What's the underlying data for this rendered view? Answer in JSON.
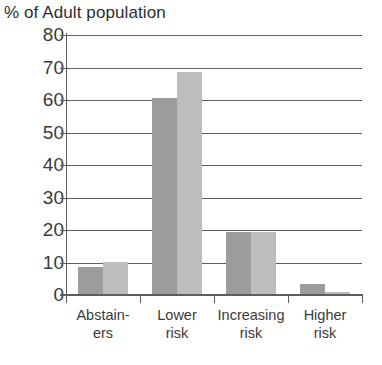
{
  "chart_data": {
    "type": "bar",
    "title": "% of Adult population",
    "xlabel": "",
    "ylabel": "",
    "ylim": [
      0,
      80
    ],
    "ytick_step": 10,
    "yticks": [
      80,
      70,
      60,
      50,
      40,
      30,
      20,
      10,
      0
    ],
    "grid": true,
    "legend": false,
    "legend_position": "none",
    "categories": [
      "Abstain-\ners",
      "Lower\nrisk",
      "Increasing\nrisk",
      "Higher\nrisk"
    ],
    "category_lines": [
      [
        "Abstain-",
        "ers"
      ],
      [
        "Lower",
        "risk"
      ],
      [
        "Increasing",
        "risk"
      ],
      [
        "Higher",
        "risk"
      ]
    ],
    "series": [
      {
        "name": "series-1",
        "color": "#9c9c9c",
        "values": [
          8.5,
          60.5,
          19.5,
          3.5
        ]
      },
      {
        "name": "series-2",
        "color": "#bdbdbd",
        "values": [
          10.3,
          68.5,
          19.5,
          1.0
        ]
      }
    ]
  },
  "colors": {
    "axis": "#5e5e5e",
    "text": "#3a3a3a",
    "title": "#2e2e2e",
    "background": "#ffffff"
  }
}
